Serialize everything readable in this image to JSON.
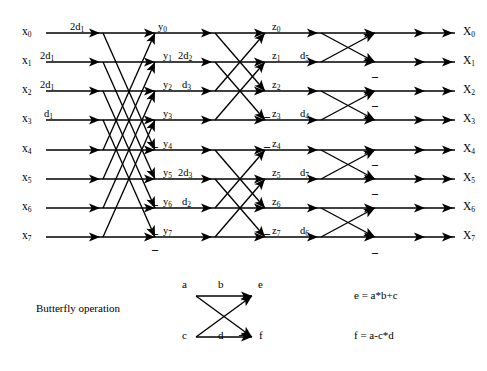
{
  "diagram": {
    "inputs": [
      {
        "label": "x₀",
        "base": "x",
        "sub": "0",
        "y": 33
      },
      {
        "label": "x₁",
        "base": "x",
        "sub": "1",
        "y": 62
      },
      {
        "label": "x₂",
        "base": "x",
        "sub": "2",
        "y": 91
      },
      {
        "label": "x₃",
        "base": "x",
        "sub": "3",
        "y": 120
      },
      {
        "label": "x₄",
        "base": "x",
        "sub": "4",
        "y": 150
      },
      {
        "label": "x₅",
        "base": "x",
        "sub": "5",
        "y": 179
      },
      {
        "label": "x₆",
        "base": "x",
        "sub": "6",
        "y": 208
      },
      {
        "label": "x₇",
        "base": "x",
        "sub": "7",
        "y": 237
      }
    ],
    "outputs": [
      {
        "label": "X₀",
        "base": "X",
        "sub": "0"
      },
      {
        "label": "X₁",
        "base": "X",
        "sub": "1"
      },
      {
        "label": "X₂",
        "base": "X",
        "sub": "2"
      },
      {
        "label": "X₃",
        "base": "X",
        "sub": "3"
      },
      {
        "label": "X₄",
        "base": "X",
        "sub": "4"
      },
      {
        "label": "X₅",
        "base": "X",
        "sub": "5"
      },
      {
        "label": "X₆",
        "base": "X",
        "sub": "6"
      },
      {
        "label": "X₇",
        "base": "X",
        "sub": "7"
      }
    ],
    "stage1": {
      "name": "stage-1",
      "span": 4,
      "coefficients": [
        {
          "text": "2d₁",
          "base": "2d",
          "sub": "1",
          "x": 70,
          "y": 22
        },
        {
          "text": "2d₁",
          "base": "2d",
          "sub": "1",
          "x": 40,
          "y": 51
        },
        {
          "text": "2d₁",
          "base": "2d",
          "sub": "1",
          "x": 40,
          "y": 80
        },
        {
          "text": "d₁",
          "base": "d",
          "sub": "1",
          "x": 44,
          "y": 109
        }
      ],
      "nodes": [
        {
          "text": "y₀",
          "base": "y",
          "sub": "0",
          "x": 158,
          "y": 22
        },
        {
          "text": "y₁",
          "base": "y",
          "sub": "1",
          "x": 163,
          "y": 51
        },
        {
          "text": "y₂",
          "base": "y",
          "sub": "2",
          "x": 163,
          "y": 80
        },
        {
          "text": "y₃",
          "base": "y",
          "sub": "3",
          "x": 163,
          "y": 109
        },
        {
          "text": "y₄",
          "base": "y",
          "sub": "4",
          "x": 163,
          "y": 139
        },
        {
          "text": "y₅",
          "base": "y",
          "sub": "5",
          "x": 163,
          "y": 168
        },
        {
          "text": "y₆",
          "base": "y",
          "sub": "6",
          "x": 163,
          "y": 197
        },
        {
          "text": "y₇",
          "base": "y",
          "sub": "7",
          "x": 163,
          "y": 226
        }
      ],
      "minus_marks": [
        {
          "x": 152,
          "y": 140
        },
        {
          "x": 152,
          "y": 198
        },
        {
          "x": 152,
          "y": 227
        },
        {
          "x": 152,
          "y": 243
        }
      ]
    },
    "stage2": {
      "name": "stage-2",
      "span": 2,
      "coefficients": [
        {
          "text": "2d₂",
          "base": "2d",
          "sub": "2",
          "x": 178,
          "y": 51
        },
        {
          "text": "d₃",
          "base": "d",
          "sub": "3",
          "x": 182,
          "y": 80
        },
        {
          "text": "2d₃",
          "base": "2d",
          "sub": "3",
          "x": 178,
          "y": 168
        },
        {
          "text": "d₂",
          "base": "d",
          "sub": "2",
          "x": 182,
          "y": 197
        }
      ],
      "nodes": [
        {
          "text": "z₀",
          "base": "z",
          "sub": "0",
          "x": 272,
          "y": 22
        },
        {
          "text": "z₁",
          "base": "z",
          "sub": "1",
          "x": 272,
          "y": 51
        },
        {
          "text": "z₂",
          "base": "z",
          "sub": "2",
          "x": 272,
          "y": 80
        },
        {
          "text": "z₃",
          "base": "z",
          "sub": "3",
          "x": 272,
          "y": 109
        },
        {
          "text": "z₄",
          "base": "z",
          "sub": "4",
          "x": 272,
          "y": 139
        },
        {
          "text": "z₅",
          "base": "z",
          "sub": "5",
          "x": 272,
          "y": 168
        },
        {
          "text": "z₆",
          "base": "z",
          "sub": "6",
          "x": 272,
          "y": 197
        },
        {
          "text": "z₇",
          "base": "z",
          "sub": "7",
          "x": 272,
          "y": 226
        }
      ],
      "minus_marks": [
        {
          "x": 264,
          "y": 110
        },
        {
          "x": 264,
          "y": 140
        },
        {
          "x": 264,
          "y": 227
        }
      ]
    },
    "stage3": {
      "name": "stage-3",
      "span": 1,
      "coefficients": [
        {
          "text": "d₅",
          "base": "d",
          "sub": "5",
          "x": 300,
          "y": 51
        },
        {
          "text": "d₄",
          "base": "d",
          "sub": "4",
          "x": 300,
          "y": 109
        },
        {
          "text": "d₇",
          "base": "d",
          "sub": "7",
          "x": 300,
          "y": 168
        },
        {
          "text": "d₆",
          "base": "d",
          "sub": "6",
          "x": 300,
          "y": 226
        }
      ],
      "minus_marks": [
        {
          "x": 372,
          "y": 70
        },
        {
          "x": 372,
          "y": 99
        },
        {
          "x": 372,
          "y": 158
        },
        {
          "x": 372,
          "y": 187
        },
        {
          "x": 372,
          "y": 246
        }
      ]
    },
    "columns": {
      "input_x": 46,
      "arrow_cols": [
        100,
        155,
        212,
        265,
        318,
        375,
        425
      ],
      "output_x": 455
    }
  },
  "legend": {
    "caption": "Butterfly operation",
    "node_labels": {
      "top_left": "a",
      "top_mid": "b",
      "top_right": "e",
      "bottom_left": "c",
      "bottom_mid": "d",
      "bottom_right": "f",
      "minus": "–"
    },
    "formulas": [
      "e = a*b+c",
      "f = a-c*d"
    ]
  },
  "colors": {
    "stroke": "#000000",
    "background": "#ffffff"
  }
}
